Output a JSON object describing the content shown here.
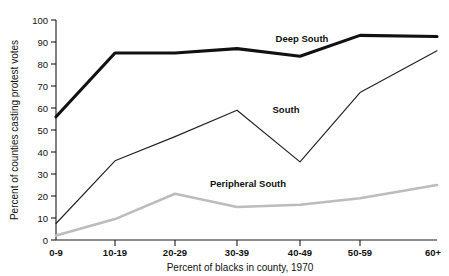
{
  "chart_data": {
    "type": "line",
    "title": "",
    "xlabel": "Percent of blacks in county, 1970",
    "ylabel": "Percent of counties casting protest votes",
    "categories": [
      "0-9",
      "10-19",
      "20-29",
      "30-39",
      "40-49",
      "50-59",
      "60+"
    ],
    "ylim": [
      0,
      100
    ],
    "yticks": [
      0,
      10,
      20,
      30,
      40,
      50,
      60,
      70,
      80,
      90,
      100
    ],
    "ytick_labels": [
      "0",
      "10",
      "20",
      "30",
      "40",
      "50",
      "60",
      "70",
      "80",
      "90",
      "100"
    ],
    "grid": false,
    "legend_position": "inline-annotations",
    "series": [
      {
        "name": "Deep South",
        "values": [
          56,
          85,
          85,
          87,
          83.5,
          93,
          92.5
        ],
        "color": "#111111",
        "style": "thick-solid",
        "label_x_category": "40-49",
        "label_value": 91
      },
      {
        "name": "South",
        "values": [
          7.5,
          36,
          47,
          59,
          35.5,
          67,
          86
        ],
        "color": "#222222",
        "style": "thin-solid",
        "label_x_category": "30-39",
        "label_value": 55
      },
      {
        "name": "Peripheral South",
        "values": [
          2,
          9.5,
          21,
          15,
          16,
          19,
          25
        ],
        "color": "#bcbcbc",
        "style": "thick-gray",
        "label_x_category": "20-29",
        "label_value": 27
      }
    ]
  },
  "axes": {
    "y_title": "Percent of counties casting protest votes",
    "x_title": "Percent of blacks in county, 1970",
    "y_labels": {
      "t100": "100",
      "t90": "90",
      "t80": "80",
      "t70": "70",
      "t60": "60",
      "t50": "50",
      "t40": "40",
      "t30": "30",
      "t20": "20",
      "t10": "10",
      "t0": "0"
    },
    "x_labels": {
      "c0": "0-9",
      "c1": "10-19",
      "c2": "20-29",
      "c3": "30-39",
      "c4": "40-49",
      "c5": "50-59",
      "c6": "60+"
    }
  },
  "annotations": {
    "deep_south": "Deep South",
    "south": "South",
    "peripheral_south": "Peripheral South"
  },
  "colors": {
    "deep_south": "#111111",
    "south": "#222222",
    "peripheral_south": "#bcbcbc",
    "axis": "#1a1a1a",
    "background": "#ffffff"
  }
}
